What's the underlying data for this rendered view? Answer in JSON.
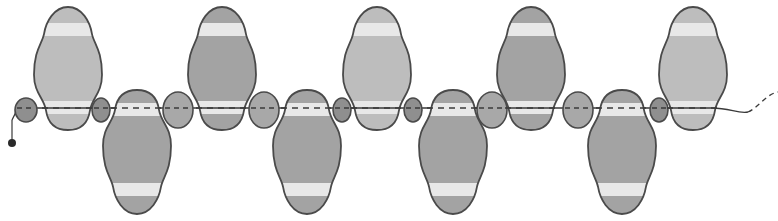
{
  "diagram": {
    "type": "beading-pattern",
    "thread_y": 108,
    "colors": {
      "outline": "#4a4a4a",
      "light_bead": "#bdbdbd",
      "dark_bead": "#a3a3a3",
      "small_dark_bead": "#8f8f8f",
      "round_bead": "#a8a8a8",
      "highlight_band": "#e8e8e8",
      "thread": "#3a3a3a",
      "end_knot": "#2a2a2a"
    },
    "top_beads": [
      {
        "cx": 68,
        "shade": "light"
      },
      {
        "cx": 222,
        "shade": "dark"
      },
      {
        "cx": 377,
        "shade": "light"
      },
      {
        "cx": 531,
        "shade": "dark"
      },
      {
        "cx": 693,
        "shade": "light"
      }
    ],
    "bottom_beads": [
      {
        "cx": 137,
        "shade": "dark"
      },
      {
        "cx": 307,
        "shade": "dark"
      },
      {
        "cx": 453,
        "shade": "dark"
      },
      {
        "cx": 622,
        "shade": "dark"
      }
    ],
    "small_beads": [
      {
        "cx": 26,
        "rx": 11,
        "ry": 12,
        "shade": "small_dark"
      },
      {
        "cx": 101,
        "rx": 9,
        "ry": 12,
        "shade": "small_dark"
      },
      {
        "cx": 178,
        "rx": 15,
        "ry": 18,
        "shade": "round"
      },
      {
        "cx": 264,
        "rx": 15,
        "ry": 18,
        "shade": "round"
      },
      {
        "cx": 342,
        "rx": 9,
        "ry": 12,
        "shade": "small_dark"
      },
      {
        "cx": 413,
        "rx": 9,
        "ry": 12,
        "shade": "small_dark"
      },
      {
        "cx": 492,
        "rx": 15,
        "ry": 18,
        "shade": "round"
      },
      {
        "cx": 578,
        "rx": 15,
        "ry": 18,
        "shade": "round"
      },
      {
        "cx": 659,
        "rx": 9,
        "ry": 12,
        "shade": "small_dark"
      }
    ]
  }
}
